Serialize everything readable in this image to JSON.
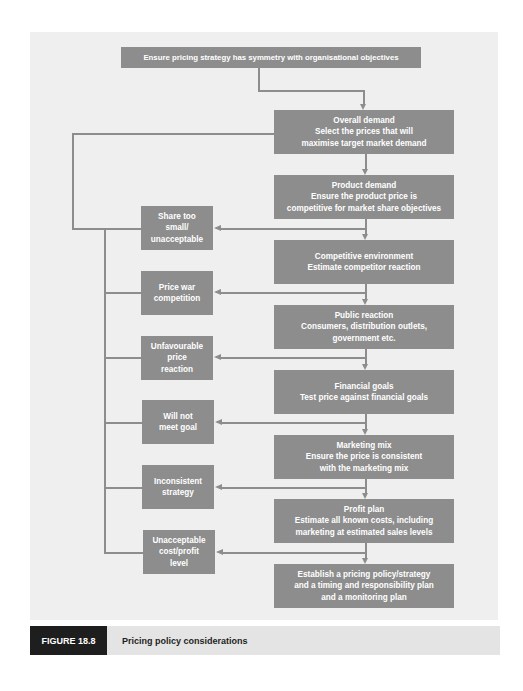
{
  "diagram": {
    "top_box": {
      "text": "Ensure pricing strategy has symmetry with organisational objectives"
    },
    "main_steps": [
      {
        "title": "Overall demand",
        "lines": [
          "Select the prices that will",
          "maximise target market demand"
        ]
      },
      {
        "title": "Product demand",
        "lines": [
          "Ensure the product price is",
          "competitive for market share objectives"
        ]
      },
      {
        "title": "Competitive environment",
        "lines": [
          "Estimate competitor reaction"
        ]
      },
      {
        "title": "Public reaction",
        "lines": [
          "Consumers, distribution outlets,",
          "government etc."
        ]
      },
      {
        "title": "Financial goals",
        "lines": [
          "Test price against financial goals"
        ]
      },
      {
        "title": "Marketing mix",
        "lines": [
          "Ensure the price is consistent",
          "with the marketing mix"
        ]
      },
      {
        "title": "Profit plan",
        "lines": [
          "Estimate all known costs, including",
          "marketing at estimated sales levels"
        ]
      },
      {
        "title": "Establish a pricing policy/strategy",
        "lines": [
          "and a timing and responsibility plan",
          "and a monitoring plan"
        ]
      }
    ],
    "failure_boxes": [
      {
        "lines": [
          "Share too",
          "small/",
          "unacceptable"
        ]
      },
      {
        "lines": [
          "Price war",
          "competition"
        ]
      },
      {
        "lines": [
          "Unfavourable",
          "price",
          "reaction"
        ]
      },
      {
        "lines": [
          "Will not",
          "meet goal"
        ]
      },
      {
        "lines": [
          "Inconsistent",
          "strategy"
        ]
      },
      {
        "lines": [
          "Unacceptable",
          "cost/profit",
          "level"
        ]
      }
    ]
  },
  "caption": {
    "label": "FIGURE 18.8",
    "title": "Pricing policy considerations"
  },
  "colors": {
    "box_fill": "#8d8d8d",
    "panel_bg": "#efefef",
    "caption_label_bg": "#1e1e1e",
    "caption_bar_bg": "#e4e4e4"
  }
}
